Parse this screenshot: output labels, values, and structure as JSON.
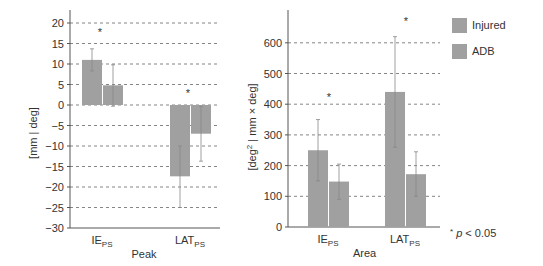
{
  "chart_data": [
    {
      "type": "bar",
      "title": "",
      "xlabel": "Peak",
      "ylabel": "[mm | deg]",
      "ylim": [
        -30,
        20
      ],
      "yticks": [
        20,
        15,
        10,
        5,
        0,
        -5,
        -10,
        -15,
        -20,
        -25,
        -30
      ],
      "grid": "dashed horizontal",
      "categories": [
        "IE_PS",
        "LAT_PS"
      ],
      "series": [
        {
          "name": "Injured",
          "values": [
            11,
            -17.4
          ],
          "error_low": [
            8.3,
            -25
          ],
          "error_high": [
            13.7,
            -10
          ],
          "color": "#a0a0a0"
        },
        {
          "name": "ADB",
          "values": [
            4.8,
            -7
          ],
          "error_low": [
            -0.3,
            -13.7
          ],
          "error_high": [
            9.8,
            -0.3
          ],
          "color": "#a0a0a0"
        }
      ],
      "annotations": [
        {
          "category": "IE_PS",
          "text": "*"
        },
        {
          "category": "LAT_PS",
          "text": "*"
        }
      ]
    },
    {
      "type": "bar",
      "title": "",
      "xlabel": "Area",
      "ylabel": "[deg² | mm × deg]",
      "ylim": [
        0,
        650
      ],
      "yticks": [
        600,
        500,
        400,
        300,
        200,
        100,
        0
      ],
      "grid": "dashed horizontal",
      "categories": [
        "IE_PS",
        "LAT_PS"
      ],
      "series": [
        {
          "name": "Injured",
          "values": [
            250,
            440
          ],
          "error_low": [
            150,
            260
          ],
          "error_high": [
            350,
            620
          ],
          "color": "#a0a0a0"
        },
        {
          "name": "ADB",
          "values": [
            148,
            172
          ],
          "error_low": [
            90,
            100
          ],
          "error_high": [
            205,
            245
          ],
          "color": "#a0a0a0"
        }
      ],
      "annotations": [
        {
          "category": "IE_PS",
          "text": "*"
        },
        {
          "category": "LAT_PS",
          "text": "*"
        }
      ]
    }
  ],
  "legend": {
    "items": [
      {
        "label": "Injured",
        "color": "#a0a0a0"
      },
      {
        "label": "ADB",
        "color": "#a0a0a0"
      }
    ],
    "position": "top-right"
  },
  "footnote": {
    "star": "*",
    "p": "p",
    "text": " < 0.05"
  },
  "labels": {
    "left_ylabel": "[mm | deg]",
    "right_ylabel_pre": "[deg",
    "right_ylabel_sup": "2",
    "right_ylabel_post": " | mm × deg]",
    "cat1_main": "IE",
    "cat1_sub": "PS",
    "cat2_main": "LAT",
    "cat2_sub": "PS",
    "left_xlabel": "Peak",
    "right_xlabel": "Area",
    "star": "*"
  }
}
